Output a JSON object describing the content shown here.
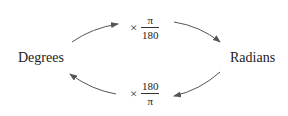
{
  "nodes": {
    "left": "Degrees",
    "right": "Radians"
  },
  "conversions": {
    "to_radians": {
      "operator": "×",
      "numerator": "π",
      "denominator": "180"
    },
    "to_degrees": {
      "operator": "×",
      "numerator": "180",
      "denominator": "π"
    }
  },
  "colors": {
    "arrow": "#555555",
    "text": "#222222"
  }
}
